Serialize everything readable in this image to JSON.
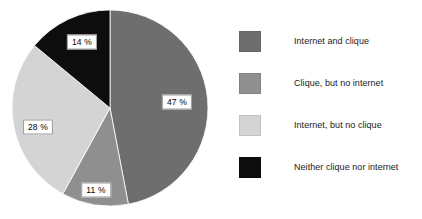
{
  "chart_data": {
    "type": "pie",
    "title": "",
    "subtitle": "",
    "xlabel": "",
    "ylabel": "",
    "grid": false,
    "legend_position": "right",
    "start_angle_deg": 0,
    "direction": "clockwise",
    "categories": [
      "Internet and clique",
      "Clique, but no internet",
      "Internet, but no clique",
      "Neither clique nor internet"
    ],
    "values": [
      47,
      11,
      28,
      14
    ],
    "value_unit": "%",
    "data_labels": [
      "47 %",
      "11 %",
      "28 %",
      "14 %"
    ],
    "colors": [
      "#6e6e6e",
      "#8f8f8f",
      "#d4d4d4",
      "#0d0d0d"
    ],
    "slices": [
      {
        "label": "Internet and clique",
        "value": 47,
        "data_label": "47 %",
        "color": "#6e6e6e",
        "label_x": 177,
        "label_y": 102
      },
      {
        "label": "Clique, but no internet",
        "value": 11,
        "data_label": "11 %",
        "color": "#8f8f8f",
        "label_x": 96,
        "label_y": 190
      },
      {
        "label": "Internet, but no clique",
        "value": 28,
        "data_label": "28 %",
        "color": "#d4d4d4",
        "label_x": 38,
        "label_y": 127
      },
      {
        "label": "Neither clique nor internet",
        "value": 14,
        "data_label": "14 %",
        "color": "#0d0d0d",
        "label_x": 82,
        "label_y": 42
      }
    ],
    "geometry": {
      "center_x": 110,
      "center_y": 108,
      "radius": 98
    }
  },
  "legend": {
    "items": [
      {
        "label": "Internet and clique",
        "color": "#6e6e6e",
        "top": 30
      },
      {
        "label": "Clique, but no internet",
        "color": "#8f8f8f",
        "top": 72
      },
      {
        "label": "Internet, but no clique",
        "color": "#d4d4d4",
        "top": 114
      },
      {
        "label": "Neither clique nor internet",
        "color": "#0d0d0d",
        "top": 156
      }
    ]
  },
  "canvas": {
    "background": "#ffffff",
    "width": 422,
    "height": 219
  }
}
